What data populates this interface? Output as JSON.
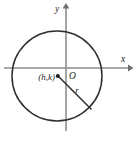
{
  "figure": {
    "name": "circle-with-center-and-radius",
    "background_color": "#ffffff",
    "stroke_color": "#2e2e2e",
    "axis_color": "#8d8d8d",
    "labels": {
      "y_axis": "y",
      "x_axis": "x",
      "origin": "O",
      "center_point": "(h,k)",
      "radius": "r"
    },
    "geometry": {
      "x_axis": {
        "x1": 4,
        "y1": 68,
        "x2": 131,
        "y2": 68
      },
      "y_axis": {
        "x1": 66,
        "y1": 4,
        "x2": 66,
        "y2": 131
      },
      "circle": {
        "cx": 57,
        "cy": 76,
        "r": 45
      },
      "center_dot": {
        "cx": 57.5,
        "cy": 76,
        "r": 2
      },
      "radius_segment": {
        "x1": 58,
        "y1": 76,
        "x2": 91,
        "y2": 109
      }
    },
    "label_positions": {
      "y_axis": {
        "x": 57,
        "y": 12
      },
      "x_axis": {
        "x": 123,
        "y": 62
      },
      "origin": {
        "x": 69,
        "y": 77
      },
      "center_point": {
        "x": 38,
        "y": 80
      },
      "radius": {
        "x": 77,
        "y": 92
      }
    }
  }
}
